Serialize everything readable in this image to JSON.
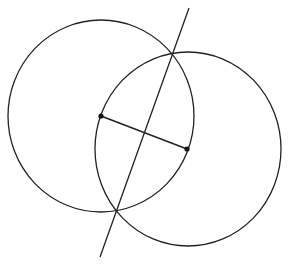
{
  "diagram": {
    "stroke_color": "#222222",
    "background": "#ffffff",
    "points": [
      {
        "id": "A",
        "x": 101,
        "y": 116
      },
      {
        "id": "B",
        "x": 187,
        "y": 149
      }
    ],
    "circles": [
      {
        "id": "circle-A",
        "cx": 101,
        "cy": 116,
        "rx": 93,
        "ry": 96
      },
      {
        "id": "circle-B",
        "cx": 188,
        "cy": 149,
        "rx": 93,
        "ry": 97
      }
    ],
    "segment_AB": {
      "x1": 101,
      "y1": 116,
      "x2": 187,
      "y2": 149
    },
    "bisector_line": {
      "x1": 189,
      "y1": 8,
      "x2": 100,
      "y2": 257
    },
    "intersections": [
      {
        "x": 172,
        "y": 55
      },
      {
        "x": 116,
        "y": 210
      }
    ]
  }
}
